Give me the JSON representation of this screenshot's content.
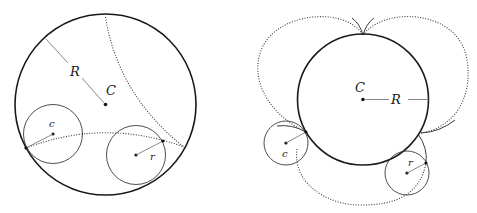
{
  "figure": {
    "panels": [
      {
        "id": "left",
        "description": "Large circle containing two small tangent circles with dotted arcs",
        "labels": {
          "big_radius": "R",
          "big_center": "C",
          "small_center": "c",
          "small_radius": "r"
        }
      },
      {
        "id": "right",
        "description": "Large circle with two small external circles and dotted/solid tangent arcs forming cusps",
        "labels": {
          "big_center": "C",
          "big_radius": "R",
          "small_center": "c",
          "small_radius": "r"
        }
      }
    ],
    "colors": {
      "stroke": "#1a1a1a",
      "radius_line": "#7a7a7a",
      "background": "#ffffff"
    }
  }
}
